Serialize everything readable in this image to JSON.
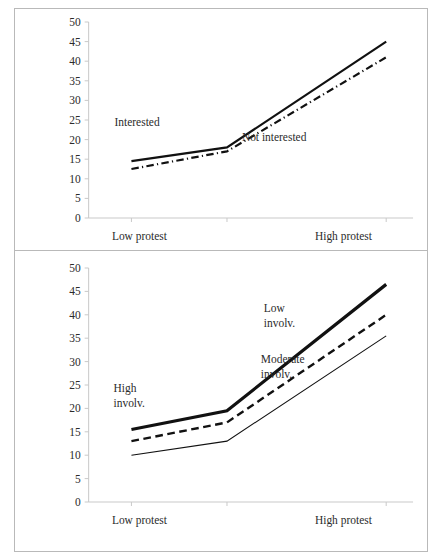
{
  "figure": {
    "background_color": "#ffffff",
    "line_color": "#111111",
    "frame_color": "#b9b9b9",
    "axis_color": "#c9c9c9"
  },
  "chart_data": [
    {
      "type": "line",
      "panel": "top",
      "title": "",
      "xlabel": "",
      "ylabel": "",
      "categories": [
        "Low protest",
        "",
        "High protest"
      ],
      "x_tick_labels": [
        "Low protest",
        "High protest"
      ],
      "y_ticks": [
        0,
        5,
        10,
        15,
        20,
        25,
        30,
        35,
        40,
        45,
        50
      ],
      "y_tick_labels": [
        "0",
        "5",
        "10",
        "15",
        "20",
        "25",
        "30",
        "35",
        "40",
        "45",
        "50"
      ],
      "ylim": [
        0,
        50
      ],
      "grid": false,
      "legend": "inline-annotations",
      "series": [
        {
          "name": "Interested",
          "label": "Interested",
          "style": "solid",
          "width": 2.2,
          "values": [
            14.5,
            18,
            45
          ]
        },
        {
          "name": "Not interested",
          "label": "Not interested",
          "style": "dash-dot",
          "width": 2.2,
          "values": [
            12.5,
            17,
            41
          ]
        }
      ]
    },
    {
      "type": "line",
      "panel": "bottom",
      "title": "",
      "xlabel": "",
      "ylabel": "",
      "categories": [
        "Low protest",
        "",
        "High protest"
      ],
      "x_tick_labels": [
        "Low protest",
        "High protest"
      ],
      "y_ticks": [
        0,
        5,
        10,
        15,
        20,
        25,
        30,
        35,
        40,
        45,
        50
      ],
      "y_tick_labels": [
        "0",
        "5",
        "10",
        "15",
        "20",
        "25",
        "30",
        "35",
        "40",
        "45",
        "50"
      ],
      "ylim": [
        0,
        50
      ],
      "grid": false,
      "legend": "inline-annotations",
      "series": [
        {
          "name": "High involv.",
          "label": "High involv.",
          "label_lines": [
            "High",
            "involv."
          ],
          "style": "solid",
          "width": 3.2,
          "values": [
            15.5,
            19.5,
            46.5
          ]
        },
        {
          "name": "Low involv.",
          "label": "Low involv.",
          "label_lines": [
            "Low",
            "involv."
          ],
          "style": "dashed",
          "width": 2.4,
          "values": [
            13,
            17,
            40
          ]
        },
        {
          "name": "Moderate involv.",
          "label": "Moderate involv.",
          "label_lines": [
            "Moderate",
            "involv."
          ],
          "style": "solid",
          "width": 1.1,
          "values": [
            10,
            13,
            35.5
          ]
        }
      ]
    }
  ]
}
